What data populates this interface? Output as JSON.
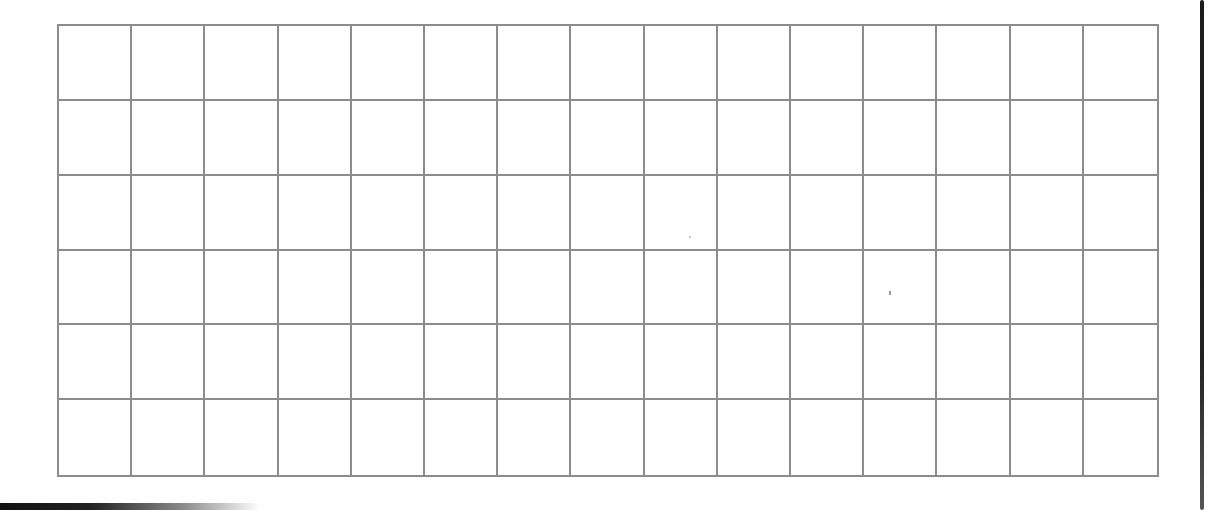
{
  "sheet": {
    "type": "blank-grid",
    "columns": 15,
    "rows": 6,
    "line_color": "#8c8c8c",
    "background_color": "#fefefe",
    "edge_color": "#1c1c1c"
  }
}
